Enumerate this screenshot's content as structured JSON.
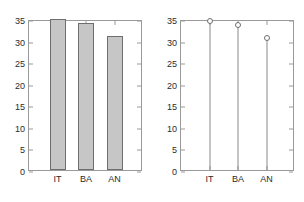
{
  "figure": {
    "background_color": "#ffffff",
    "axis_color": "#9a9a9a",
    "text_color": "#2b2b2b",
    "bar_fill_color": "#c6c6c6",
    "bar_edge_color": "#6e6e6e",
    "stem_color": "#8a8a8a",
    "marker_edge_color": "#6e6e6e"
  },
  "chart_data": [
    {
      "type": "bar",
      "title": "",
      "xlabel": "",
      "ylabel": "",
      "categories": [
        "IT",
        "BA",
        "AN"
      ],
      "values": [
        35,
        34,
        31
      ],
      "ylim": [
        0,
        35
      ],
      "yticks": [
        0,
        5,
        10,
        15,
        20,
        25,
        30,
        35
      ],
      "ytick_labels": [
        "0",
        "5",
        "10",
        "15",
        "20",
        "25",
        "30",
        "35"
      ],
      "xtick_labels": [
        "IT",
        "BA",
        "AN"
      ],
      "grid": false,
      "legend": "none",
      "panel": "left"
    },
    {
      "type": "scatter",
      "style": "stem",
      "title": "",
      "xlabel": "",
      "ylabel": "",
      "categories": [
        "IT",
        "BA",
        "AN"
      ],
      "values": [
        35,
        34,
        31
      ],
      "ylim": [
        0,
        35
      ],
      "yticks": [
        0,
        5,
        10,
        15,
        20,
        25,
        30,
        35
      ],
      "ytick_labels": [
        "0",
        "5",
        "10",
        "15",
        "20",
        "25",
        "30",
        "35"
      ],
      "xtick_labels": [
        "IT",
        "BA",
        "AN"
      ],
      "grid": false,
      "legend": "none",
      "marker": "open-circle",
      "panel": "right"
    }
  ]
}
